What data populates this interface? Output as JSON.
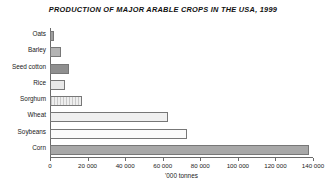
{
  "chart_data": {
    "type": "bar",
    "orientation": "horizontal",
    "title": "PRODUCTION OF MAJOR ARABLE CROPS IN THE USA, 1999",
    "xlabel": "'000 tonnes",
    "ylabel": "",
    "xlim": [
      0,
      140000
    ],
    "grid": false,
    "legend": null,
    "tick_labels": [
      "0",
      "20 000",
      "40 000",
      "60 000",
      "80 000",
      "100 000",
      "120 000",
      "140 000"
    ],
    "tick_values": [
      0,
      20000,
      40000,
      60000,
      80000,
      100000,
      120000,
      140000
    ],
    "categories": [
      "Oats",
      "Barley",
      "Seed cotton",
      "Rice",
      "Sorghum",
      "Wheat",
      "Soybeans",
      "Corn"
    ],
    "values": [
      2000,
      6000,
      10000,
      8000,
      17000,
      63000,
      73000,
      138000
    ],
    "bars": [
      {
        "label": "Oats",
        "value": 2000,
        "fill": "f-solidmid"
      },
      {
        "label": "Barley",
        "value": 6000,
        "fill": "f-midlite"
      },
      {
        "label": "Seed cotton",
        "value": 10000,
        "fill": "f-dark"
      },
      {
        "label": "Rice",
        "value": 8000,
        "fill": "f-verylite"
      },
      {
        "label": "Sorghum",
        "value": 17000,
        "fill": "f-hatch"
      },
      {
        "label": "Wheat",
        "value": 63000,
        "fill": "f-pale"
      },
      {
        "label": "Soybeans",
        "value": 73000,
        "fill": "f-white"
      },
      {
        "label": "Corn",
        "value": 138000,
        "fill": "f-grey"
      }
    ]
  },
  "colors": {
    "background": "#ffffff",
    "axis": "#6a6a6a",
    "text": "#1a1a1a",
    "bar_border": "#777777"
  }
}
